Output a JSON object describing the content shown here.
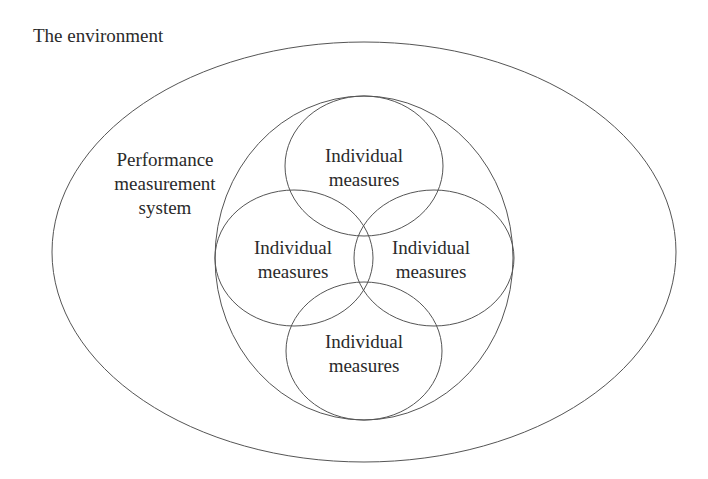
{
  "diagram": {
    "environment_label": "The environment",
    "system_label": [
      "Performance",
      "measurement",
      "system"
    ],
    "measures": [
      {
        "position": "top",
        "line1": "Individual",
        "line2": "measures"
      },
      {
        "position": "left",
        "line1": "Individual",
        "line2": "measures"
      },
      {
        "position": "right",
        "line1": "Individual",
        "line2": "measures"
      },
      {
        "position": "bottom",
        "line1": "Individual",
        "line2": "measures"
      }
    ],
    "stroke_color": "#555555"
  }
}
